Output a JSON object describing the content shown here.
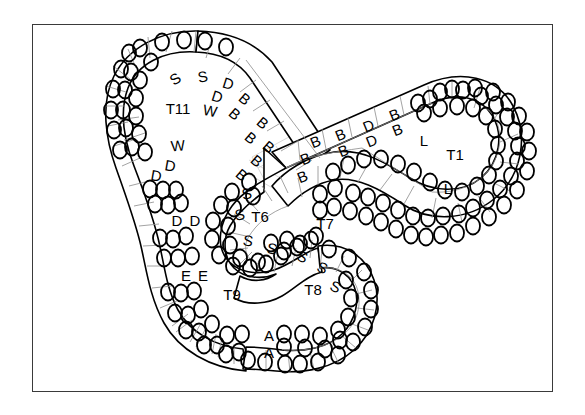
{
  "figure": {
    "kind": "ribbon-topology-diagram",
    "background_color": "#ffffff",
    "frame": {
      "color": "#3a3a3a",
      "x": 32,
      "y": 24,
      "width": 521,
      "height": 368
    },
    "stroke_color": "#000000",
    "grid_color": "#9a9a9a",
    "overlap_grid_color": "#cccccc",
    "circle_color": "#000000"
  },
  "region_labels": [
    {
      "name": "region-label-t11",
      "text": "T11",
      "x": 178,
      "y": 110,
      "size": 15
    },
    {
      "name": "region-label-t1",
      "text": "T1",
      "x": 455,
      "y": 156,
      "size": 15
    },
    {
      "name": "region-label-t6",
      "text": "T6",
      "x": 260,
      "y": 218,
      "size": 15
    },
    {
      "name": "region-label-t7",
      "text": "T7",
      "x": 325,
      "y": 225,
      "size": 15
    },
    {
      "name": "region-label-t8",
      "text": "T8",
      "x": 313,
      "y": 291,
      "size": 15
    },
    {
      "name": "region-label-t9",
      "text": "T9",
      "x": 232,
      "y": 296,
      "size": 15
    }
  ],
  "cell_letters": [
    {
      "text": "S",
      "x": 176,
      "y": 80,
      "rot": -34
    },
    {
      "text": "S",
      "x": 203,
      "y": 78,
      "rot": -10
    },
    {
      "text": "D",
      "x": 228,
      "y": 85,
      "rot": 18
    },
    {
      "text": "D",
      "x": 217,
      "y": 98,
      "rot": 18
    },
    {
      "text": "B",
      "x": 244,
      "y": 100,
      "rot": 40
    },
    {
      "text": "B",
      "x": 234,
      "y": 115,
      "rot": 40
    },
    {
      "text": "B",
      "x": 262,
      "y": 124,
      "rot": 40
    },
    {
      "text": "B",
      "x": 250,
      "y": 139,
      "rot": 40
    },
    {
      "text": "B",
      "x": 256,
      "y": 162,
      "rot": 40
    },
    {
      "text": "B",
      "x": 268,
      "y": 148,
      "rot": 40
    },
    {
      "text": "B",
      "x": 241,
      "y": 176,
      "rot": 40
    },
    {
      "text": "W",
      "x": 210,
      "y": 112,
      "rot": 10
    },
    {
      "text": "W",
      "x": 178,
      "y": 147,
      "rot": -5
    },
    {
      "text": "D",
      "x": 170,
      "y": 167,
      "rot": 10
    },
    {
      "text": "D",
      "x": 156,
      "y": 177,
      "rot": 10
    },
    {
      "text": "D",
      "x": 177,
      "y": 222,
      "rot": 0
    },
    {
      "text": "D",
      "x": 195,
      "y": 222,
      "rot": 0
    },
    {
      "text": "E",
      "x": 186,
      "y": 277,
      "rot": 0
    },
    {
      "text": "E",
      "x": 203,
      "y": 277,
      "rot": 0
    },
    {
      "text": "B",
      "x": 316,
      "y": 143,
      "rot": -22
    },
    {
      "text": "B",
      "x": 341,
      "y": 136,
      "rot": -22
    },
    {
      "text": "B",
      "x": 344,
      "y": 152,
      "rot": -22
    },
    {
      "text": "D",
      "x": 369,
      "y": 127,
      "rot": -22
    },
    {
      "text": "D",
      "x": 372,
      "y": 142,
      "rot": -22
    },
    {
      "text": "B",
      "x": 395,
      "y": 116,
      "rot": -22
    },
    {
      "text": "B",
      "x": 398,
      "y": 131,
      "rot": -22
    },
    {
      "text": "B",
      "x": 306,
      "y": 160,
      "rot": -22
    },
    {
      "text": "B",
      "x": 303,
      "y": 178,
      "rot": -22
    },
    {
      "text": "L",
      "x": 424,
      "y": 142,
      "rot": 0
    },
    {
      "text": "L",
      "x": 448,
      "y": 190,
      "rot": 0
    },
    {
      "text": "S",
      "x": 247,
      "y": 195,
      "rot": -10
    },
    {
      "text": "S",
      "x": 240,
      "y": 216,
      "rot": -10
    },
    {
      "text": "S",
      "x": 248,
      "y": 242,
      "rot": 10
    },
    {
      "text": "S",
      "x": 272,
      "y": 250,
      "rot": 10
    },
    {
      "text": "S",
      "x": 302,
      "y": 258,
      "rot": 24
    },
    {
      "text": "S",
      "x": 322,
      "y": 269,
      "rot": 24
    },
    {
      "text": "S",
      "x": 335,
      "y": 288,
      "rot": 24
    },
    {
      "text": "A",
      "x": 269,
      "y": 337,
      "rot": 0
    },
    {
      "text": "A",
      "x": 269,
      "y": 354,
      "rot": 0
    }
  ],
  "legend_keys": [
    "S",
    "D",
    "B",
    "W",
    "E",
    "L",
    "A"
  ],
  "lobe_ids": [
    "T1",
    "T6",
    "T7",
    "T8",
    "T9",
    "T11"
  ]
}
